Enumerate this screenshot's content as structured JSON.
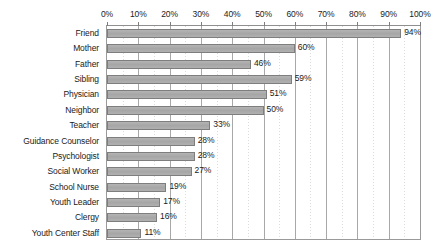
{
  "chart_data": {
    "type": "bar",
    "orientation": "horizontal",
    "title": "",
    "xlabel": "",
    "ylabel": "",
    "xlim": [
      0,
      100
    ],
    "grid": true,
    "legend": false,
    "axis_position": "top",
    "value_suffix": "%",
    "tick_labels": [
      "0%",
      "10%",
      "20%",
      "30%",
      "40%",
      "50%",
      "60%",
      "70%",
      "80%",
      "90%",
      "100%"
    ],
    "tick_values": [
      0,
      10,
      20,
      30,
      40,
      50,
      60,
      70,
      80,
      90,
      100
    ],
    "categories": [
      "Friend",
      "Mother",
      "Father",
      "Sibling",
      "Physician",
      "Neighbor",
      "Teacher",
      "Guidance Counselor",
      "Psychologist",
      "Social Worker",
      "School Nurse",
      "Youth Leader",
      "Clergy",
      "Youth Center Staff"
    ],
    "values": [
      94,
      60,
      46,
      59,
      51,
      50,
      33,
      28,
      28,
      27,
      19,
      17,
      16,
      11
    ],
    "data_labels": [
      "94%",
      "60%",
      "46%",
      "59%",
      "51%",
      "50%",
      "33%",
      "28%",
      "28%",
      "27%",
      "19%",
      "17%",
      "16%",
      "11%"
    ],
    "colors": {
      "bar_fill": "#a9a9a9",
      "bar_border": "#7e7e7e",
      "plot_border": "#9a9a9a",
      "gridline_major": "#a8a8a8",
      "gridline_minor": "#dcdcdc",
      "background": "#ffffff",
      "text": "#1a1a1a"
    }
  }
}
